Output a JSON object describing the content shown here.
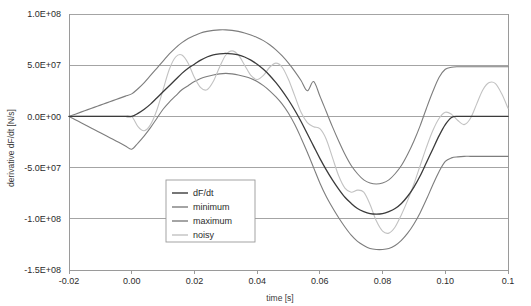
{
  "chart_data": {
    "type": "line",
    "title": "",
    "xlabel": "time [s]",
    "ylabel": "derivative dF/dt [N/s]",
    "xlim": [
      -0.02,
      0.12
    ],
    "ylim": [
      -150000000.0,
      100000000.0
    ],
    "grid": true,
    "legend_position": "inside-bottom-left",
    "xticks": [
      -0.02,
      0.0,
      0.02,
      0.04,
      0.06,
      0.08,
      0.1,
      0.12
    ],
    "xticklabels": [
      "-0.02",
      "0.00",
      "0.02",
      "0.04",
      "0.06",
      "0.08",
      "0.10",
      "0.1"
    ],
    "yticks": [
      100000000.0,
      50000000.0,
      0.0,
      -50000000.0,
      -100000000.0,
      -150000000.0
    ],
    "yticklabels": [
      "1.0E+08",
      "5.0E+07",
      "0.0E+00",
      "-5.0E+07",
      "-1.0E+08",
      "-1.5E+08"
    ],
    "x": [
      -0.02,
      -0.018,
      -0.016,
      -0.014,
      -0.012,
      -0.01,
      -0.008,
      -0.006,
      -0.004,
      -0.002,
      0.0,
      0.002,
      0.004,
      0.006,
      0.008,
      0.01,
      0.012,
      0.014,
      0.016,
      0.018,
      0.02,
      0.022,
      0.024,
      0.026,
      0.028,
      0.03,
      0.032,
      0.034,
      0.036,
      0.038,
      0.04,
      0.042,
      0.044,
      0.046,
      0.048,
      0.05,
      0.052,
      0.054,
      0.056,
      0.058,
      0.06,
      0.062,
      0.064,
      0.066,
      0.068,
      0.07,
      0.072,
      0.074,
      0.076,
      0.078,
      0.08,
      0.082,
      0.084,
      0.086,
      0.088,
      0.09,
      0.092,
      0.094,
      0.096,
      0.098,
      0.1,
      0.102,
      0.104,
      0.106,
      0.108,
      0.11,
      0.112,
      0.114,
      0.116,
      0.118,
      0.12
    ],
    "series": [
      {
        "name": "dF/dt",
        "color": "#3b3b3b",
        "width": 1.3,
        "values": [
          0,
          0,
          0,
          0,
          0,
          0,
          0,
          0,
          0,
          0,
          0,
          3000000.0,
          7000000.0,
          12000000.0,
          18000000.0,
          24000000.0,
          30000000.0,
          36000000.0,
          42000000.0,
          47000000.0,
          51000000.0,
          55000000.0,
          58000000.0,
          60000000.0,
          61000000.0,
          61500000.0,
          61000000.0,
          60000000.0,
          58000000.0,
          55000000.0,
          51000000.0,
          46000000.0,
          40000000.0,
          33000000.0,
          25000000.0,
          16000000.0,
          6000000.0,
          -5000000.0,
          -17000000.0,
          -29000000.0,
          -41000000.0,
          -52000000.0,
          -62000000.0,
          -71000000.0,
          -79000000.0,
          -85000000.0,
          -90000000.0,
          -93000000.0,
          -95000000.0,
          -95500000.0,
          -95000000.0,
          -93000000.0,
          -90000000.0,
          -85000000.0,
          -78000000.0,
          -69000000.0,
          -58000000.0,
          -45000000.0,
          -32000000.0,
          -19000000.0,
          -8000000.0,
          -1000000.0,
          0,
          0,
          0,
          0,
          0,
          0,
          0,
          0,
          0
        ]
      },
      {
        "name": "minimum",
        "color": "#7d7d7d",
        "width": 1.1,
        "values": [
          0,
          -3200000.0,
          -6400000.0,
          -9600000.0,
          -12800000.0,
          -16000000.0,
          -19200000.0,
          -22400000.0,
          -25600000.0,
          -28800000.0,
          -32000000.0,
          -26000000.0,
          -19000000.0,
          -11000000.0,
          -2000000.0,
          7000000.0,
          14000000.0,
          20000000.0,
          26000000.0,
          30000000.0,
          34000000.0,
          37000000.0,
          39000000.0,
          40500000.0,
          41500000.0,
          42000000.0,
          41500000.0,
          40500000.0,
          39000000.0,
          37000000.0,
          34000000.0,
          30000000.0,
          25000000.0,
          19000000.0,
          12000000.0,
          3000000.0,
          -8000000.0,
          -21000000.0,
          -35000000.0,
          -50000000.0,
          -65000000.0,
          -78000000.0,
          -89000000.0,
          -99000000.0,
          -108000000.0,
          -116000000.0,
          -122000000.0,
          -126000000.0,
          -129000000.0,
          -130000000.0,
          -130000000.0,
          -129000000.0,
          -126000000.0,
          -121000000.0,
          -114000000.0,
          -105000000.0,
          -94000000.0,
          -81000000.0,
          -67000000.0,
          -54000000.0,
          -44000000.0,
          -40500000.0,
          -39500000.0,
          -39000000.0,
          -39000000.0,
          -39000000.0,
          -39000000.0,
          -39000000.0,
          -39000000.0,
          -39000000.0,
          -39000000.0
        ]
      },
      {
        "name": "maximum",
        "color": "#7d7d7d",
        "width": 1.1,
        "values": [
          0,
          2200000.0,
          4400000.0,
          6600000.0,
          8800000.0,
          11000000.0,
          13200000.0,
          15400000.0,
          17600000.0,
          19800000.0,
          22000000.0,
          27000000.0,
          33000000.0,
          40000000.0,
          47000000.0,
          54000000.0,
          61000000.0,
          67000000.0,
          72000000.0,
          76000000.0,
          79000000.0,
          81500000.0,
          83000000.0,
          84000000.0,
          84500000.0,
          84500000.0,
          84000000.0,
          83000000.0,
          81500000.0,
          79500000.0,
          77000000.0,
          74000000.0,
          70000000.0,
          65000000.0,
          59000000.0,
          52000000.0,
          44000000.0,
          35000000.0,
          25000000.0,
          34000000.0,
          20000000.0,
          5000000.0,
          -10000000.0,
          -24000000.0,
          -37000000.0,
          -48000000.0,
          -56000000.0,
          -62000000.0,
          -65000000.0,
          -66000000.0,
          -65000000.0,
          -62000000.0,
          -56000000.0,
          -48000000.0,
          -37000000.0,
          -24000000.0,
          -9000000.0,
          8000000.0,
          24000000.0,
          38000000.0,
          46000000.0,
          48000000.0,
          48500000.0,
          48500000.0,
          48500000.0,
          48500000.0,
          48500000.0,
          48500000.0,
          48500000.0,
          48500000.0,
          48500000.0
        ]
      },
      {
        "name": "noisy",
        "color": "#c2c2c2",
        "width": 1.1,
        "values": [
          0,
          0,
          0,
          0,
          0,
          0,
          0,
          0,
          0,
          0,
          0,
          -10000000.0,
          -14000000.0,
          -8000000.0,
          6000000.0,
          26000000.0,
          46000000.0,
          58000000.0,
          60000000.0,
          52000000.0,
          38000000.0,
          28000000.0,
          26000000.0,
          34000000.0,
          48000000.0,
          60000000.0,
          64000000.0,
          60000000.0,
          50000000.0,
          40000000.0,
          36000000.0,
          40000000.0,
          48000000.0,
          52000000.0,
          48000000.0,
          36000000.0,
          20000000.0,
          4000000.0,
          -6000000.0,
          -10000000.0,
          -12000000.0,
          -22000000.0,
          -40000000.0,
          -58000000.0,
          -70000000.0,
          -74000000.0,
          -72000000.0,
          -74000000.0,
          -86000000.0,
          -102000000.0,
          -112000000.0,
          -114000000.0,
          -108000000.0,
          -96000000.0,
          -82000000.0,
          -66000000.0,
          -48000000.0,
          -30000000.0,
          -14000000.0,
          -2000000.0,
          4000000.0,
          2000000.0,
          -4000000.0,
          -8000000.0,
          -2000000.0,
          12000000.0,
          26000000.0,
          33000000.0,
          32000000.0,
          22000000.0,
          8000000.0
        ]
      }
    ]
  },
  "axes": {
    "frame_color": "#9a9a9a",
    "grid_color": "#9a9a9a"
  },
  "legend": {
    "items": [
      {
        "label": "dF/dt"
      },
      {
        "label": "minimum"
      },
      {
        "label": "maximum"
      },
      {
        "label": "noisy"
      }
    ]
  }
}
